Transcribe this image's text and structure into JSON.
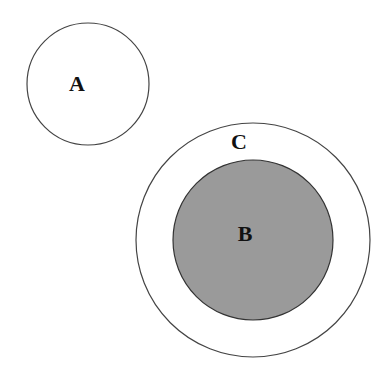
{
  "diagram": {
    "type": "set-relationship",
    "background": "#ffffff",
    "stroke_color": "#444444",
    "circles": [
      {
        "id": "A",
        "label": "A",
        "cx": 88,
        "cy": 84,
        "r": 61,
        "fill": "#ffffff",
        "label_x": 77,
        "label_y": 91
      },
      {
        "id": "C",
        "label": "C",
        "cx": 253,
        "cy": 240,
        "r": 117,
        "fill": "#ffffff",
        "label_x": 239,
        "label_y": 149
      },
      {
        "id": "B",
        "label": "B",
        "cx": 253,
        "cy": 240,
        "r": 80,
        "fill": "#9a9a9a",
        "label_x": 245,
        "label_y": 241
      }
    ],
    "relations": [
      {
        "subset": "B",
        "superset": "C"
      },
      {
        "disjoint": [
          "A",
          "C"
        ]
      }
    ]
  }
}
